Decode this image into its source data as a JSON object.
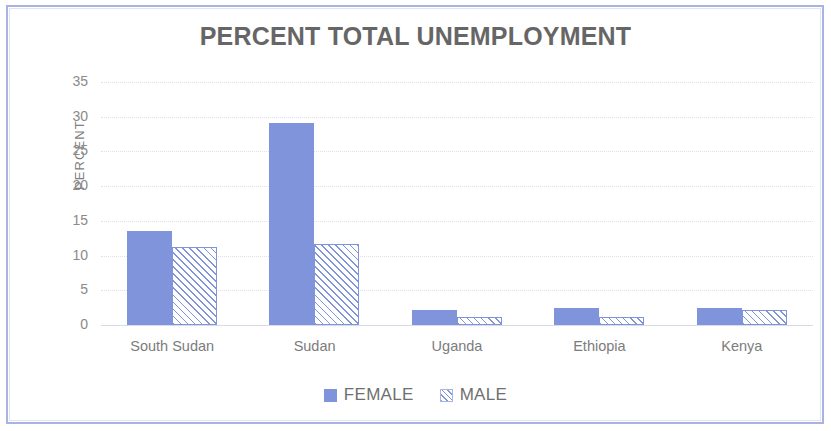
{
  "chart_data": {
    "type": "bar",
    "title": "PERCENT TOTAL UNEMPLOYMENT",
    "xlabel": "",
    "ylabel": "PERCENT",
    "categories": [
      "South Sudan",
      "Sudan",
      "Uganda",
      "Ethiopia",
      "Kenya"
    ],
    "series": [
      {
        "name": "FEMALE",
        "values": [
          13.5,
          29.1,
          2.1,
          2.5,
          2.5
        ],
        "color": "#8094dc",
        "pattern": "solid"
      },
      {
        "name": "MALE",
        "values": [
          11.2,
          11.6,
          1.1,
          1.2,
          2.2
        ],
        "color": "#8094dc",
        "pattern": "diagonal-hatch"
      }
    ],
    "ylim": [
      0,
      35
    ],
    "yticks": [
      "0",
      "5",
      "10",
      "15",
      "20",
      "25",
      "30",
      "35"
    ],
    "ytick_values": [
      0,
      5,
      10,
      15,
      20,
      25,
      30,
      35
    ],
    "grid": true,
    "grid_axis": "y",
    "legend_position": "bottom"
  },
  "legend": {
    "items": [
      {
        "label": "FEMALE"
      },
      {
        "label": "MALE"
      }
    ]
  },
  "icons": {
    "female_swatch": "solid-square-icon",
    "male_swatch": "hatched-square-icon"
  }
}
